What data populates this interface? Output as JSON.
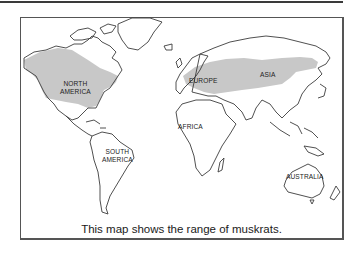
{
  "map": {
    "caption": "This map shows the range of muskrats.",
    "range_fill_color": "#c8c8c8",
    "outline_color": "#3c3c3c",
    "labels": {
      "north_america": [
        "NORTH",
        "AMERICA"
      ],
      "south_america": [
        "SOUTH",
        "AMERICA"
      ],
      "europe": "EUROPE",
      "asia": "ASIA",
      "africa": "AFRICA",
      "australia": "AUSTRALIA"
    },
    "shaded_regions": [
      "North America (Canada and USA)",
      "Northern Europe and Asia"
    ]
  }
}
